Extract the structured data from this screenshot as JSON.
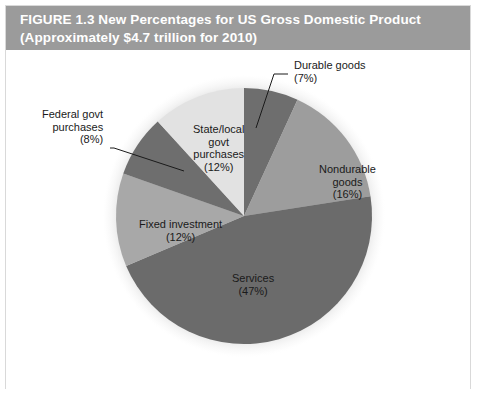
{
  "figure": {
    "caption_line_1": "FIGURE 1.3  New Percentages for US Gross Domestic Product",
    "caption_line_2": "(Approximately $4.7 trillion for 2010)",
    "caption_background": "#9b9b9b",
    "caption_text_color": "#ffffff",
    "frame_border_color": "#d9d9d9",
    "background": "#ffffff"
  },
  "chart_data": {
    "type": "pie",
    "title": "FIGURE 1.3  New Percentages for US Gross Domestic Product",
    "subtitle": "(Approximately $4.7 trillion for 2010)",
    "units": "percent of US Gross Domestic Product",
    "total_label": "Approximately $4.7 trillion for 2010",
    "start_angle_deg": 0,
    "direction": "clockwise",
    "legend": "none (direct labels with leader lines)",
    "grid": false,
    "categories": [
      "Durable goods",
      "Nondurable goods",
      "Services",
      "Fixed investment",
      "Federal govt purchases",
      "State/local govt purchases"
    ],
    "values": [
      7,
      16,
      47,
      12,
      8,
      12
    ],
    "slices": [
      {
        "name": "Durable goods",
        "value": 7,
        "percent_label": "(7%)",
        "color": "#6e6e6e",
        "label_line_1": "Durable goods",
        "label_line_2": "(7%)",
        "leader_line": true
      },
      {
        "name": "Nondurable goods",
        "value": 16,
        "percent_label": "(16%)",
        "color": "#9d9d9d",
        "label_line_1": "Nondurable",
        "label_line_2": "goods",
        "label_line_3": "(16%)",
        "leader_line": false
      },
      {
        "name": "Services",
        "value": 47,
        "percent_label": "(47%)",
        "color": "#6b6b6b",
        "label_line_1": "Services",
        "label_line_2": "(47%)",
        "leader_line": false
      },
      {
        "name": "Fixed investment",
        "value": 12,
        "percent_label": "(12%)",
        "color": "#a8a8a8",
        "label_line_1": "Fixed investment",
        "label_line_2": "(12%)",
        "leader_line": false
      },
      {
        "name": "Federal govt purchases",
        "value": 8,
        "percent_label": "(8%)",
        "color": "#6e6e6e",
        "label_line_1": "Federal govt",
        "label_line_2": "purchases",
        "label_line_3": "(8%)",
        "leader_line": true
      },
      {
        "name": "State/local govt purchases",
        "value": 12,
        "percent_label": "(12%)",
        "color": "#e2e2e2",
        "label_line_1": "State/local",
        "label_line_2": "govt",
        "label_line_3": "purchases",
        "label_line_4": "(12%)",
        "leader_line": false
      }
    ]
  },
  "labels": {
    "durable": "Durable goods\n(7%)",
    "nondurable": "Nondurable\ngoods\n(16%)",
    "services": "Services\n(47%)",
    "fixed_investment": "Fixed investment\n(12%)",
    "federal_govt": "Federal govt\npurchases\n(8%)",
    "state_local_govt": "State/local\ngovt\npurchases\n(12%)"
  }
}
